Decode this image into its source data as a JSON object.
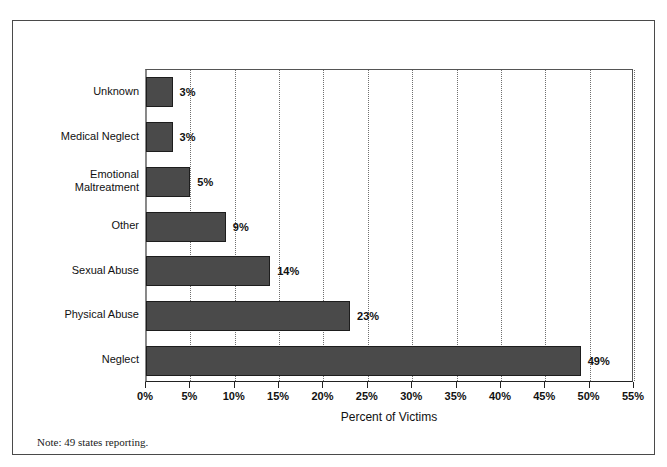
{
  "figure": {
    "top_cut_text": "",
    "note": "Note: 49 states reporting.",
    "source_line": ""
  },
  "chart_data": {
    "type": "bar",
    "orientation": "horizontal",
    "title": "",
    "categories": [
      "Neglect",
      "Physical Abuse",
      "Sexual Abuse",
      "Other",
      "Emotional Maltreatment",
      "Medical Neglect",
      "Unknown"
    ],
    "values": [
      49,
      23,
      14,
      9,
      5,
      3,
      3
    ],
    "value_labels": [
      "49%",
      "23%",
      "14%",
      "9%",
      "5%",
      "3%",
      "3%"
    ],
    "xlabel": "Percent of Victims",
    "ylabel": "",
    "xlim": [
      0,
      55
    ],
    "xticks": [
      0,
      5,
      10,
      15,
      20,
      25,
      30,
      35,
      40,
      45,
      50,
      55
    ],
    "xticklabels": [
      "0%",
      "5%",
      "10%",
      "15%",
      "20%",
      "25%",
      "30%",
      "35%",
      "40%",
      "45%",
      "50%",
      "55%"
    ],
    "grid": "vertical-dotted",
    "legend": "none",
    "bar_fill": "#4a4a4a",
    "bar_edge": "#1d1d1d"
  }
}
